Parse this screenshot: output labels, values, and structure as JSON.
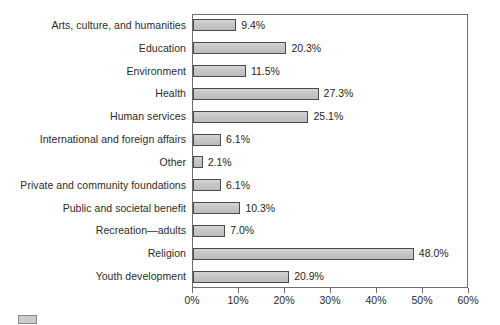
{
  "chart_data": {
    "type": "bar",
    "orientation": "horizontal",
    "title": "",
    "subtitle": "",
    "xlabel": "",
    "ylabel": "",
    "xlim": [
      0,
      60
    ],
    "grid": false,
    "legend_position": "bottom-left",
    "categories": [
      "Arts, culture, and humanities",
      "Education",
      "Environment",
      "Health",
      "Human services",
      "International and foreign affairs",
      "Other",
      "Private and community foundations",
      "Public and societal benefit",
      "Recreation—adults",
      "Religion",
      "Youth development"
    ],
    "values": [
      9.4,
      20.3,
      11.5,
      27.3,
      25.1,
      6.1,
      2.1,
      6.1,
      10.3,
      7.0,
      48.0,
      20.9
    ],
    "value_labels": [
      "9.4%",
      "20.3%",
      "11.5%",
      "27.3%",
      "25.1%",
      "6.1%",
      "2.1%",
      "6.1%",
      "10.3%",
      "7.0%",
      "48.0%",
      "20.9%"
    ],
    "xtick_values": [
      0,
      10,
      20,
      30,
      40,
      50,
      60
    ],
    "xtick_labels": [
      "0%",
      "10%",
      "20%",
      "30%",
      "40%",
      "50%",
      "60%"
    ],
    "bar_fill_color": "#c9c9c9",
    "bar_border_color": "#4a4a4a",
    "frame_color": "#6e6e6e",
    "background_color": "#ffffff"
  },
  "legend": {
    "label": "",
    "swatch_color": "#cccccc"
  }
}
